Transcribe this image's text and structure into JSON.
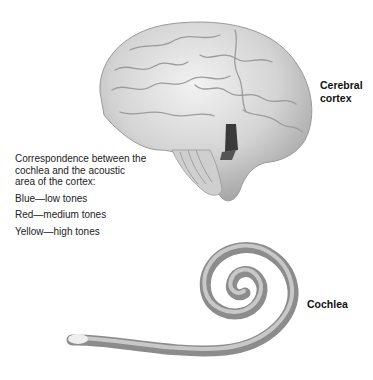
{
  "labels": {
    "cerebral_cortex": [
      "Cerebral",
      "cortex"
    ],
    "cochlea": "Cochlea"
  },
  "legend": {
    "intro": "Correspondence between the\ncochlea and the acoustic\narea of the cortex:",
    "items": [
      {
        "text": "Blue—low tones",
        "color": "#3355cc"
      },
      {
        "text": "Red—medium tones",
        "color": "#cc3333"
      },
      {
        "text": "Yellow—high tones",
        "color": "#e8c830"
      }
    ]
  }
}
